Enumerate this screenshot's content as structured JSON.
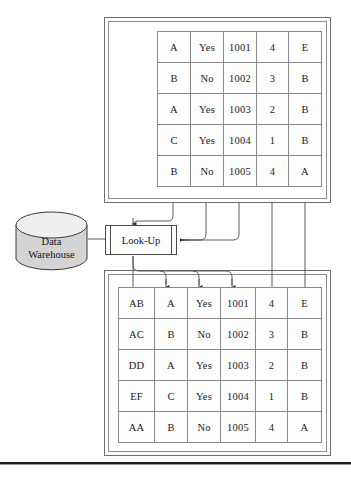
{
  "diagram": {
    "source_table": {
      "name": "source-records-table",
      "columns": 5,
      "rows": [
        [
          "A",
          "Yes",
          "1001",
          "4",
          "E"
        ],
        [
          "B",
          "No",
          "1002",
          "3",
          "B"
        ],
        [
          "A",
          "Yes",
          "1003",
          "2",
          "B"
        ],
        [
          "C",
          "Yes",
          "1004",
          "1",
          "B"
        ],
        [
          "B",
          "No",
          "1005",
          "4",
          "A"
        ]
      ]
    },
    "target_table": {
      "name": "target-records-table",
      "columns": 6,
      "rows": [
        [
          "AB",
          "A",
          "Yes",
          "1001",
          "4",
          "E"
        ],
        [
          "AC",
          "B",
          "No",
          "1002",
          "3",
          "B"
        ],
        [
          "DD",
          "A",
          "Yes",
          "1003",
          "2",
          "B"
        ],
        [
          "EF",
          "C",
          "Yes",
          "1004",
          "1",
          "B"
        ],
        [
          "AA",
          "B",
          "No",
          "1005",
          "4",
          "A"
        ]
      ]
    },
    "lookup": {
      "label": "Look-Up"
    },
    "warehouse": {
      "label_line1": "Data",
      "label_line2": "Warehouse"
    },
    "colors": {
      "line": "#4a4a4a",
      "frame": "#6e6e6e",
      "cell_border": "#8a8a8a",
      "cylinder_fill": "#d4d4d4",
      "cylinder_top": "#efefef",
      "text": "#1a1a1a",
      "rule": "#1c1c1c"
    }
  }
}
